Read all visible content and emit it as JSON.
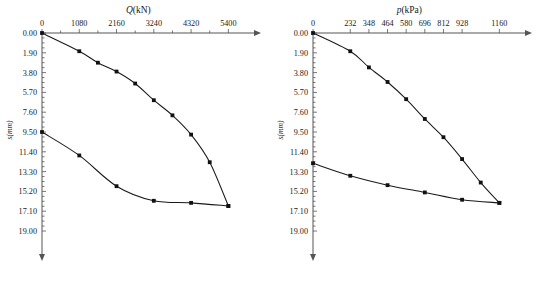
{
  "figure": {
    "panels": [
      {
        "id": "panel-left",
        "xaxis": {
          "title": "Q",
          "title_unit": "(kN)",
          "ticks": [
            "0",
            "1080",
            "2160",
            "3240",
            "4320",
            "5400"
          ],
          "values": [
            0,
            1080,
            2160,
            3240,
            4320,
            5400
          ],
          "min": 0,
          "max": 5940,
          "minor_per_major": 2
        },
        "yaxis": {
          "title": "s",
          "title_unit": "(mm)",
          "ticks": [
            "0.00",
            "1.90",
            "3.80",
            "5.70",
            "7.60",
            "9.50",
            "11.40",
            "13.30",
            "15.20",
            "17.10",
            "19.00"
          ],
          "values": [
            0.0,
            1.9,
            3.8,
            5.7,
            7.6,
            9.5,
            11.4,
            13.3,
            15.2,
            17.1,
            19.0
          ],
          "min": 0.0,
          "max": 19.0,
          "minor_per_major": 4
        }
      },
      {
        "id": "panel-right",
        "xaxis": {
          "title": "p",
          "title_unit": "(kPa)",
          "ticks": [
            "0",
            "232",
            "348",
            "464",
            "580",
            "696",
            "812",
            "928",
            "1160"
          ],
          "values": [
            0,
            232,
            348,
            464,
            580,
            696,
            812,
            928,
            1160
          ],
          "min": 0,
          "max": 1276,
          "minor_per_major": 0
        },
        "yaxis": {
          "title": "s",
          "title_unit": "(mm)",
          "ticks": [
            "0.00",
            "1.90",
            "3.80",
            "5.70",
            "7.60",
            "9.50",
            "11.40",
            "13.30",
            "15.20",
            "17.10",
            "19.00"
          ],
          "values": [
            0.0,
            1.9,
            3.8,
            5.7,
            7.6,
            9.5,
            11.4,
            13.3,
            15.2,
            17.1,
            19.0
          ],
          "min": 0.0,
          "max": 19.0,
          "minor_per_major": 4
        }
      }
    ]
  },
  "chart_data": [
    {
      "type": "line",
      "title": "Q(kN)",
      "xlabel": "Q (kN)",
      "ylabel": "s (mm)",
      "xlim": [
        0,
        5940
      ],
      "ylim": [
        0,
        19.0
      ],
      "y_inverted": true,
      "grid": false,
      "legend": "none",
      "series": [
        {
          "name": "loading",
          "x": [
            0,
            1080,
            1620,
            2160,
            2700,
            3240,
            3780,
            4320,
            4860,
            5400
          ],
          "y": [
            0.0,
            1.75,
            2.85,
            3.7,
            4.85,
            6.45,
            7.9,
            9.75,
            12.4,
            16.6
          ]
        },
        {
          "name": "unloading",
          "x": [
            0,
            1080,
            2160,
            3240,
            4320,
            5400
          ],
          "y": [
            9.5,
            11.75,
            14.7,
            16.1,
            16.3,
            16.6
          ]
        }
      ]
    },
    {
      "type": "line",
      "title": "p(kPa)",
      "xlabel": "p (kPa)",
      "ylabel": "s (mm)",
      "xlim": [
        0,
        1276
      ],
      "ylim": [
        0,
        19.0
      ],
      "y_inverted": true,
      "grid": false,
      "legend": "none",
      "series": [
        {
          "name": "loading",
          "x": [
            0,
            232,
            348,
            464,
            580,
            696,
            812,
            928,
            1044,
            1160
          ],
          "y": [
            0.0,
            1.75,
            3.3,
            4.7,
            6.35,
            8.25,
            10.0,
            12.1,
            14.35,
            16.3
          ]
        },
        {
          "name": "unloading",
          "x": [
            0,
            232,
            464,
            696,
            928,
            1160
          ],
          "y": [
            12.5,
            13.7,
            14.6,
            15.3,
            16.0,
            16.3
          ]
        }
      ]
    }
  ]
}
